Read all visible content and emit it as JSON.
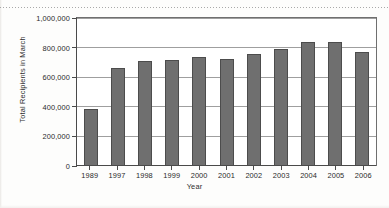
{
  "chart_data": {
    "type": "bar",
    "title": "",
    "xlabel": "Year",
    "ylabel": "Total Recipients in March",
    "categories": [
      "1989",
      "1997",
      "1998",
      "1999",
      "2000",
      "2001",
      "2002",
      "2003",
      "2004",
      "2005",
      "2006"
    ],
    "values": [
      385000,
      660000,
      712000,
      718000,
      735000,
      722000,
      755000,
      792000,
      838000,
      840000,
      768000
    ],
    "ylim": [
      0,
      1000000
    ],
    "ytick_labels": [
      "0",
      "200,000",
      "400,000",
      "600,000",
      "800,000",
      "1,000,000"
    ],
    "ytick_values": [
      0,
      200000,
      400000,
      600000,
      800000,
      1000000
    ],
    "grid": true,
    "legend": null,
    "bar_color": "#6f6f6f",
    "bar_edge_color": "#4c4c4c",
    "axis_color": "#4a4a4a",
    "gridline_color": "#8e8e8e",
    "plot_background": "#ffffff"
  }
}
